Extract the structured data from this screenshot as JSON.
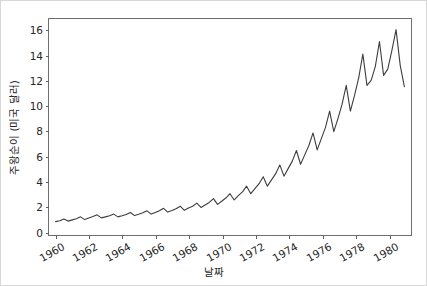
{
  "chart_data": {
    "type": "line",
    "title": "",
    "xlabel": "날짜",
    "ylabel": "주왕순이 (미국 달러)",
    "xlim": [
      1959.6,
      1981.4
    ],
    "ylim": [
      -0.35,
      16.9
    ],
    "grid": false,
    "legend": null,
    "line_color": "#3d3d3d",
    "line_width": 1.1,
    "xticks": [
      1960,
      1962,
      1964,
      1966,
      1968,
      1970,
      1972,
      1974,
      1976,
      1978,
      1980
    ],
    "xtick_labels": [
      "1960",
      "1962",
      "1964",
      "1966",
      "1968",
      "1970",
      "1972",
      "1974",
      "1976",
      "1978",
      "1980"
    ],
    "xtick_rotation": -30,
    "yticks": [
      0,
      2,
      4,
      6,
      8,
      10,
      12,
      14,
      16
    ],
    "ytick_labels": [
      "0",
      "2",
      "4",
      "6",
      "8",
      "10",
      "12",
      "14",
      "16"
    ],
    "series": [
      {
        "name": "주왕순이",
        "x": [
          1960.0,
          1960.25,
          1960.5,
          1960.75,
          1961.0,
          1961.25,
          1961.5,
          1961.75,
          1962.0,
          1962.25,
          1962.5,
          1962.75,
          1963.0,
          1963.25,
          1963.5,
          1963.75,
          1964.0,
          1964.25,
          1964.5,
          1964.75,
          1965.0,
          1965.25,
          1965.5,
          1965.75,
          1966.0,
          1966.25,
          1966.5,
          1966.75,
          1967.0,
          1967.25,
          1967.5,
          1967.75,
          1968.0,
          1968.25,
          1968.5,
          1968.75,
          1969.0,
          1969.25,
          1969.5,
          1969.75,
          1970.0,
          1970.25,
          1970.5,
          1970.75,
          1971.0,
          1971.25,
          1971.5,
          1971.75,
          1972.0,
          1972.25,
          1972.5,
          1972.75,
          1973.0,
          1973.25,
          1973.5,
          1973.75,
          1974.0,
          1974.25,
          1974.5,
          1974.75,
          1975.0,
          1975.25,
          1975.5,
          1975.75,
          1976.0,
          1976.25,
          1976.5,
          1976.75,
          1977.0,
          1977.25,
          1977.5,
          1977.75,
          1978.0,
          1978.25,
          1978.5,
          1978.75,
          1979.0,
          1979.25,
          1979.5,
          1979.75,
          1980.0,
          1980.25,
          1980.5,
          1980.75,
          1981.0
        ],
        "values": [
          0.72,
          0.79,
          0.93,
          0.76,
          0.86,
          0.95,
          1.1,
          0.88,
          1.0,
          1.12,
          1.26,
          1.02,
          1.1,
          1.18,
          1.32,
          1.1,
          1.18,
          1.28,
          1.45,
          1.2,
          1.3,
          1.42,
          1.58,
          1.32,
          1.45,
          1.58,
          1.78,
          1.48,
          1.6,
          1.75,
          1.95,
          1.62,
          1.8,
          1.95,
          2.2,
          1.85,
          2.05,
          2.25,
          2.55,
          2.1,
          2.35,
          2.6,
          2.95,
          2.45,
          2.8,
          3.1,
          3.55,
          2.95,
          3.35,
          3.75,
          4.3,
          3.55,
          4.05,
          4.55,
          5.25,
          4.35,
          4.95,
          5.55,
          6.4,
          5.3,
          6.05,
          6.8,
          7.8,
          6.45,
          7.35,
          8.25,
          9.55,
          7.9,
          8.95,
          10.1,
          11.6,
          9.55,
          10.8,
          12.2,
          14.1,
          11.6,
          12.0,
          13.1,
          15.1,
          12.4,
          12.9,
          14.4,
          16.05,
          13.2,
          11.5
        ]
      }
    ]
  },
  "axis": {
    "xlabel": "날짜",
    "ylabel": "주왕순이 (미국 달러)"
  }
}
